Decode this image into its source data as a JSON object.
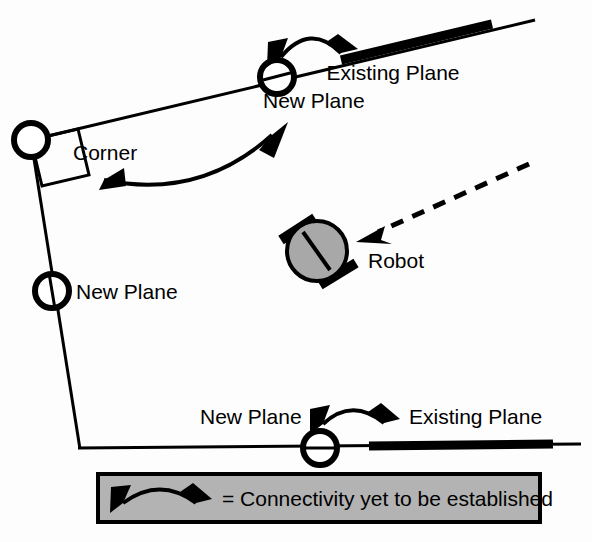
{
  "figure": {
    "background_color": "#fdfdfd",
    "stroke_color": "#000000",
    "robot_fill_color": "#a8a8a8",
    "legend_fill_color": "#b3b3b3"
  },
  "labels": {
    "existing_plane_top": "Existing Plane",
    "new_plane_top": "New Plane",
    "corner": "Corner",
    "new_plane_left": "New Plane",
    "robot": "Robot",
    "new_plane_bottom": "New Plane",
    "existing_plane_bottom": "Existing Plane"
  },
  "legend": {
    "text": "= Connectivity yet to be established",
    "arrow_icon": "double-headed-curved-arrow-icon"
  },
  "icons": {
    "new_plane_marker": "circle-vertex-icon",
    "corner_marker": "right-angle-icon",
    "robot_body": "robot-circle-icon",
    "pointer": "dashed-pointer-arrow-icon",
    "connectivity_arrow": "double-headed-curved-arrow-icon"
  },
  "geometry": {
    "top_plane_line": "from (31,140) to (535,20)",
    "left_plane_line": "from (31,140) to (80,448)",
    "bottom_plane_line": "from (78,447) to (580,444)",
    "top_existing_segment": "from (340,60) to (492,22)",
    "bottom_existing_segment": "from (368,446) to (552,444)",
    "robot_center": "(317,251)",
    "robot_radius": "30"
  }
}
